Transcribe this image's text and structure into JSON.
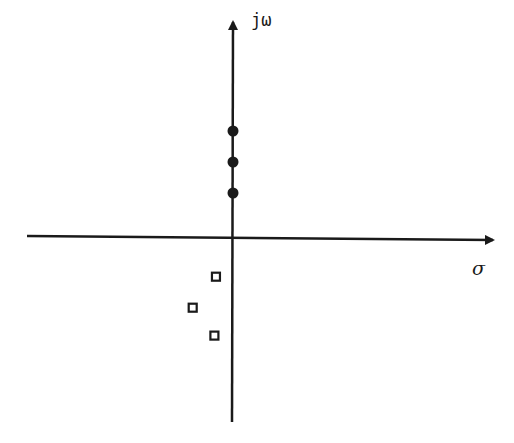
{
  "diagram": {
    "axes": {
      "real_label": "σ",
      "imag_label": "jω"
    },
    "colors": {
      "ink": "#1a1a1a",
      "background": "#ffffff"
    },
    "markers": {
      "filled_circles": [
        {
          "re": 0,
          "im": 3
        },
        {
          "re": 0,
          "im": 2
        },
        {
          "re": 0,
          "im": 1
        }
      ],
      "open_squares": [
        {
          "re": -0.55,
          "im": -1.7
        },
        {
          "re": -1.3,
          "im": -2.7
        },
        {
          "re": -0.6,
          "im": -3.6
        }
      ]
    }
  }
}
